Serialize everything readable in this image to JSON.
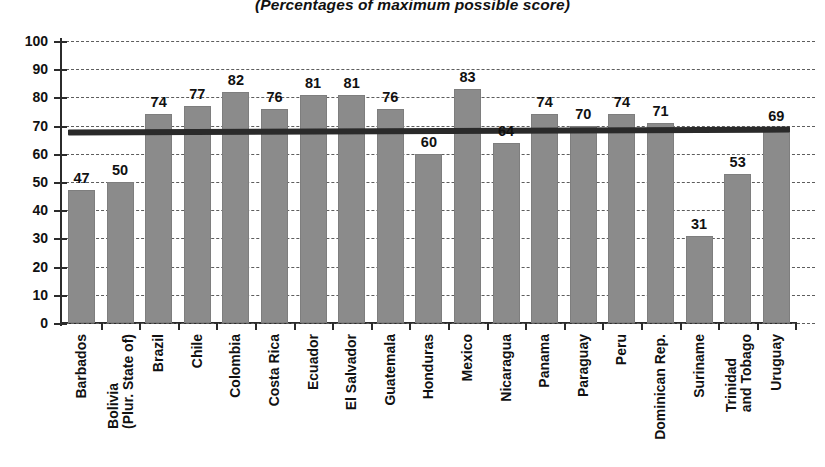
{
  "subtitle": "(Percentages of maximum possible score)",
  "colors": {
    "bar": "#8b8b8b",
    "reference_line": "#2a2a2a",
    "axis": "#2b2b2b",
    "gridline": "#5d5d5d",
    "text": "#111111",
    "background": "#ffffff"
  },
  "axes": {
    "y_ticks": [
      "0",
      "10",
      "20",
      "30",
      "40",
      "50",
      "60",
      "70",
      "80",
      "90",
      "100"
    ],
    "y_min": 0,
    "y_max": 100,
    "y_step": 10
  },
  "reference_line": {
    "value": 68,
    "label": ""
  },
  "chart_data": {
    "type": "bar",
    "title": "",
    "subtitle": "(Percentages of maximum possible score)",
    "xlabel": "",
    "ylabel": "",
    "ylim": [
      0,
      100
    ],
    "ytick_step": 10,
    "grid": true,
    "legend": "none",
    "reference_line_value": 68,
    "categories": [
      "Barbados",
      "Bolivia (Plur. State of)",
      "Brazil",
      "Chile",
      "Colombia",
      "Costa Rica",
      "Ecuador",
      "El Salvador",
      "Guatemala",
      "Honduras",
      "Mexico",
      "Nicaragua",
      "Panama",
      "Paraguay",
      "Peru",
      "Dominican Rep.",
      "Suriname",
      "Trinidad and Tobago",
      "Uruguay"
    ],
    "values": [
      47,
      50,
      74,
      77,
      82,
      76,
      81,
      81,
      76,
      60,
      83,
      64,
      74,
      70,
      74,
      71,
      31,
      53,
      69
    ],
    "data_labels": [
      "47",
      "50",
      "74",
      "77",
      "82",
      "76",
      "81",
      "81",
      "76",
      "60",
      "83",
      "64",
      "74",
      "70",
      "74",
      "71",
      "31",
      "53",
      "69"
    ]
  },
  "category_label_lines": [
    [
      "Barbados"
    ],
    [
      "Bolivia",
      "(Plur. State of)"
    ],
    [
      "Brazil"
    ],
    [
      "Chile"
    ],
    [
      "Colombia"
    ],
    [
      "Costa Rica"
    ],
    [
      "Ecuador"
    ],
    [
      "El Salvador"
    ],
    [
      "Guatemala"
    ],
    [
      "Honduras"
    ],
    [
      "Mexico"
    ],
    [
      "Nicaragua"
    ],
    [
      "Panama"
    ],
    [
      "Paraguay"
    ],
    [
      "Peru"
    ],
    [
      "Dominican Rep."
    ],
    [
      "Suriname"
    ],
    [
      "Trinidad",
      "and Tobago"
    ],
    [
      "Uruguay"
    ]
  ]
}
